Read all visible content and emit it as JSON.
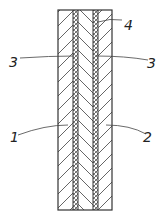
{
  "figure": {
    "type": "cross-section diagram",
    "labels": [
      {
        "id": "1",
        "text": "1",
        "refers_to": "left outer layer"
      },
      {
        "id": "2",
        "text": "2",
        "refers_to": "right outer layer"
      },
      {
        "id": "3a",
        "text": "3",
        "refers_to": "left thin interlayer"
      },
      {
        "id": "3b",
        "text": "3",
        "refers_to": "right thin interlayer"
      },
      {
        "id": "4",
        "text": "4",
        "refers_to": "middle layer"
      }
    ],
    "colors": {
      "line": "#333333",
      "hatch": "#555555",
      "background": "#ffffff"
    }
  }
}
